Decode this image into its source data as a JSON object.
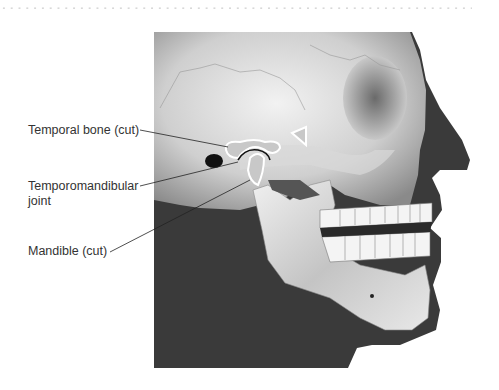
{
  "figure": {
    "labels": [
      {
        "id": "temporal-bone",
        "text": "Temporal bone (cut)"
      },
      {
        "id": "tmj",
        "line1": "Temporomandibular",
        "line2": "joint"
      },
      {
        "id": "mandible",
        "text": "Mandible (cut)"
      }
    ],
    "colors": {
      "background": "#ffffff",
      "soft_tissue": "#3a3a3a",
      "bone_light": "#e6e6e6",
      "bone_mid": "#b8b8b8",
      "label_text": "#333333",
      "leader_line": "#222222"
    }
  }
}
